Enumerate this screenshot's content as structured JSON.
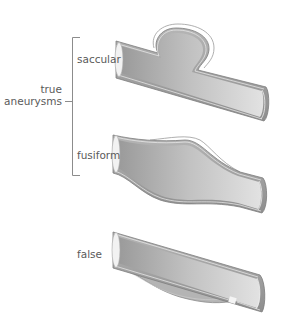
{
  "diagram": {
    "group": {
      "label_line1": "true",
      "label_line2": "aneurysms",
      "members": [
        "saccular",
        "fusiform"
      ]
    },
    "vessels": [
      {
        "id": "saccular",
        "label": "saccular",
        "category": "true aneurysm"
      },
      {
        "id": "fusiform",
        "label": "fusiform",
        "category": "true aneurysm"
      },
      {
        "id": "false",
        "label": "false",
        "category": "false aneurysm"
      }
    ],
    "colors": {
      "vessel_wall": "#a8a8a8",
      "vessel_wall_dark": "#7d7d7d",
      "vessel_lumen_light": "#e6e6e6",
      "vessel_lumen_dark": "#a3a3a3",
      "bracket": "#8c8c8c",
      "label_text": "#5a5a5a"
    }
  }
}
